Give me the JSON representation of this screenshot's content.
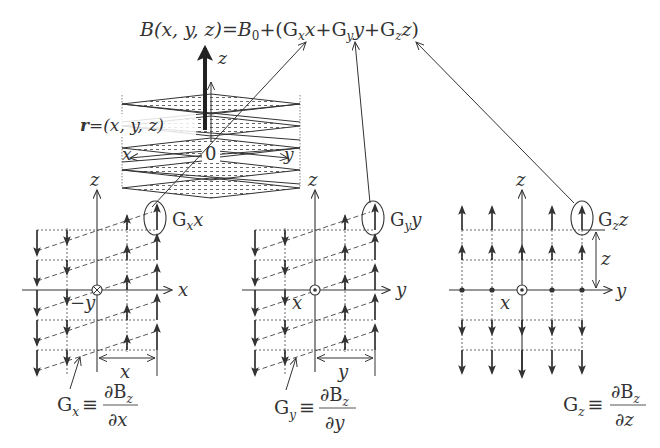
{
  "equation": {
    "lhs": "B(x, y, z)",
    "eq": "=",
    "b0": "B",
    "b0_sub": "0",
    "plus": "+(",
    "gx": "G",
    "gx_sub": "x",
    "gx_var": "x",
    "plus2": "+",
    "gy": "G",
    "gy_sub": "y",
    "gy_var": "y",
    "plus3": "+",
    "gz": "G",
    "gz_sub": "z",
    "gz_var": "z",
    "close": ")"
  },
  "cube": {
    "z_label": "z",
    "x_label": "x",
    "y_label": "y",
    "origin_label": "0",
    "r_vec": "r",
    "r_def": "=(x, y, z)"
  },
  "panels": [
    {
      "id": "gx",
      "h_axis": "x",
      "v_axis": "z",
      "center_symbol": "into-page",
      "offset_label": "−y",
      "span_label": "x",
      "callout_label": "G",
      "callout_sub": "x",
      "callout_var": "x",
      "def_G": "G",
      "def_sub": "x",
      "def_num": "∂B",
      "def_num_sub": "z",
      "def_den": "∂x"
    },
    {
      "id": "gy",
      "h_axis": "y",
      "v_axis": "z",
      "center_symbol": "out-of-page",
      "offset_label": "x",
      "span_label": "y",
      "callout_label": "G",
      "callout_sub": "y",
      "callout_var": "y",
      "def_G": "G",
      "def_sub": "y",
      "def_num": "∂B",
      "def_num_sub": "z",
      "def_den": "∂y"
    },
    {
      "id": "gz",
      "h_axis": "y",
      "v_axis": "z",
      "center_symbol": "out-of-page",
      "offset_label": "x",
      "span_label": "z",
      "callout_label": "G",
      "callout_sub": "z",
      "callout_var": "z",
      "def_G": "G",
      "def_sub": "z",
      "def_num": "∂B",
      "def_num_sub": "z",
      "def_den": "∂z"
    }
  ],
  "identity_symbol": "≡",
  "colors": {
    "ink": "#333333",
    "light": "#555555",
    "background": "#ffffff"
  }
}
